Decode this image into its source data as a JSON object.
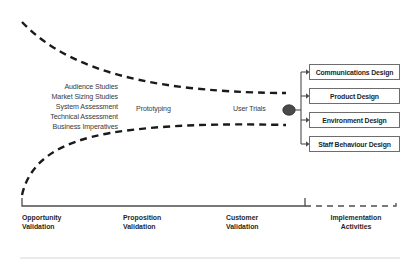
{
  "diagram": {
    "type": "funnel-process-diagram",
    "colors": {
      "funnel_curve": "#1a1a1a",
      "box_border": "#6d6d6d",
      "node_fill": "#4a4a4a",
      "text": "#1f1f1f",
      "muted_text": "#3a3a3a",
      "footer_rule": "#d8d8d8"
    },
    "inputs": {
      "label": "Funnel inputs",
      "items": [
        "Audience Studies",
        "Market Sizing Studies",
        "System Assessment",
        "Technical Assessment",
        "Business Imperatives"
      ]
    },
    "stage_notes": [
      {
        "name": "prototyping",
        "text": "Prototyping"
      },
      {
        "name": "user-trials",
        "text": "User Trials"
      }
    ],
    "node": {
      "name": "funnel-convergence-node",
      "shape": "ellipse"
    },
    "outputs": {
      "label": "Implementation design outputs",
      "items": [
        "Communications Design",
        "Product Design",
        "Environment Design",
        "Staff Behaviour Design"
      ]
    },
    "phases": [
      {
        "line1": "Opportunity",
        "line2": "Validation"
      },
      {
        "line1": "Proposition",
        "line2": "Validation"
      },
      {
        "line1": "Customer",
        "line2": "Validation"
      },
      {
        "line1": "Implementation",
        "line2": "Activities"
      }
    ],
    "axis": {
      "solid_bracket": "validation phases",
      "dashed_bracket": "implementation activities"
    }
  }
}
